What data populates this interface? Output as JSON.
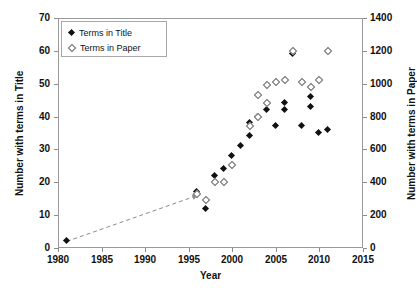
{
  "chart_data": {
    "type": "scatter",
    "title": "",
    "xlabel": "Year",
    "ylabel": "Number  with terms in Title",
    "y2label": "Number with terms in Paper",
    "xlim": [
      1980,
      2015
    ],
    "ylim": [
      0,
      70
    ],
    "y2lim": [
      0,
      1400
    ],
    "xticks": [
      1980,
      1985,
      1990,
      1995,
      2000,
      2005,
      2010,
      2015
    ],
    "yticks": [
      0,
      10,
      20,
      30,
      40,
      50,
      60,
      70
    ],
    "y2ticks": [
      0,
      200,
      400,
      600,
      800,
      1000,
      1200,
      1400
    ],
    "grid": false,
    "legend_position": "top-left",
    "series": [
      {
        "name": "Terms in Title",
        "marker": "filled-diamond",
        "color": "#111111",
        "axis": "left",
        "points": [
          {
            "x": 1981,
            "y": 2
          },
          {
            "x": 1996,
            "y": 17
          },
          {
            "x": 1997,
            "y": 12
          },
          {
            "x": 1998,
            "y": 22
          },
          {
            "x": 1999,
            "y": 24
          },
          {
            "x": 2000,
            "y": 28
          },
          {
            "x": 2001,
            "y": 31
          },
          {
            "x": 2002,
            "y": 34
          },
          {
            "x": 2002,
            "y": 38
          },
          {
            "x": 2003,
            "y": 40
          },
          {
            "x": 2004,
            "y": 42
          },
          {
            "x": 2005,
            "y": 37
          },
          {
            "x": 2006,
            "y": 42
          },
          {
            "x": 2006,
            "y": 44
          },
          {
            "x": 2007,
            "y": 59
          },
          {
            "x": 2008,
            "y": 37
          },
          {
            "x": 2009,
            "y": 43
          },
          {
            "x": 2009,
            "y": 46
          },
          {
            "x": 2010,
            "y": 35
          },
          {
            "x": 2011,
            "y": 36
          }
        ]
      },
      {
        "name": "Terms in Paper",
        "marker": "open-diamond",
        "color": "#6b6b6b",
        "axis": "right",
        "points": [
          {
            "x": 1996,
            "y": 330
          },
          {
            "x": 1997,
            "y": 290
          },
          {
            "x": 1998,
            "y": 400
          },
          {
            "x": 1999,
            "y": 405
          },
          {
            "x": 2000,
            "y": 505
          },
          {
            "x": 2002,
            "y": 745
          },
          {
            "x": 2003,
            "y": 795
          },
          {
            "x": 2003,
            "y": 930
          },
          {
            "x": 2004,
            "y": 880
          },
          {
            "x": 2004,
            "y": 995
          },
          {
            "x": 2005,
            "y": 1010
          },
          {
            "x": 2006,
            "y": 1020
          },
          {
            "x": 2007,
            "y": 1200
          },
          {
            "x": 2008,
            "y": 1010
          },
          {
            "x": 2009,
            "y": 980
          },
          {
            "x": 2010,
            "y": 1020
          },
          {
            "x": 2011,
            "y": 1200
          }
        ]
      }
    ],
    "trendline": {
      "style": "dashed",
      "color": "#8a8a8a",
      "from": {
        "x": 1981,
        "y": 2
      },
      "to": {
        "x": 1996,
        "y": 16
      }
    }
  },
  "legend": {
    "entries": [
      {
        "label": "Terms in Title",
        "marker": "filled-diamond"
      },
      {
        "label": "Terms in Paper",
        "marker": "open-diamond"
      }
    ]
  }
}
